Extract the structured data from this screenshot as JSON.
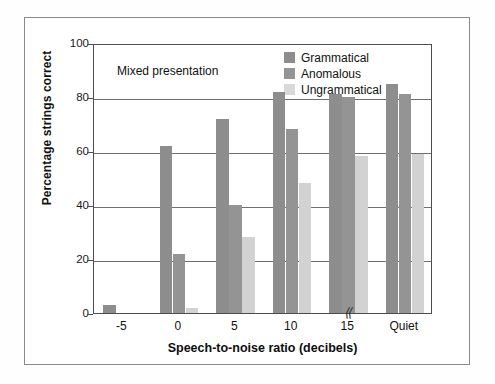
{
  "annotation": "Mixed presentation",
  "legend": {
    "items": [
      {
        "label": "Grammatical",
        "color": "#8d8d8d"
      },
      {
        "label": "Anomalous",
        "color": "#949494"
      },
      {
        "label": "Ungrammatical",
        "color": "#d9d9d9"
      }
    ]
  },
  "axis": {
    "break_glyph": "⟨⟨"
  },
  "chart_data": {
    "type": "bar",
    "title": "",
    "xlabel": "Speech-to-noise ratio (decibels)",
    "ylabel": "Percentage strings correct",
    "categories": [
      "-5",
      "0",
      "5",
      "10",
      "15",
      "Quiet"
    ],
    "yticks": [
      0,
      20,
      40,
      60,
      80,
      100
    ],
    "ylim": [
      0,
      100
    ],
    "grid": "horizontal",
    "legend_position": "top-right",
    "annotations": [
      "Mixed presentation"
    ],
    "axis_break": "between 15 and Quiet",
    "series": [
      {
        "name": "Grammatical",
        "color": "#8d8d8d",
        "values": [
          3,
          62,
          72,
          82,
          81,
          85
        ]
      },
      {
        "name": "Anomalous",
        "color": "#949494",
        "values": [
          0,
          22,
          40,
          68,
          80,
          81
        ]
      },
      {
        "name": "Ungrammatical",
        "color": "#d2d2d2",
        "values": [
          0,
          2,
          28,
          48,
          58,
          59
        ]
      }
    ]
  }
}
